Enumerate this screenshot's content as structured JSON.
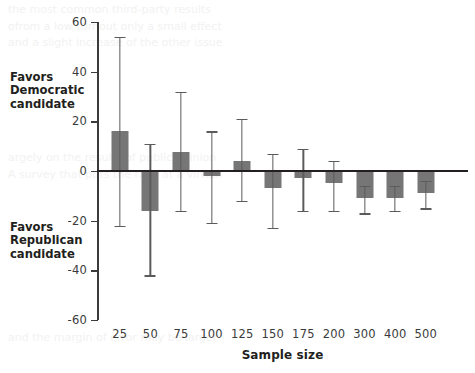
{
  "chart_data": {
    "type": "bar",
    "title": "",
    "subtitle": "",
    "xlabel": "Sample size",
    "ylabel": "",
    "categories": [
      "25",
      "50",
      "75",
      "100",
      "125",
      "150",
      "175",
      "200",
      "300",
      "400",
      "500"
    ],
    "values": [
      16,
      -16,
      7.5,
      -2,
      4,
      -7,
      -3,
      -5,
      -11,
      -11,
      -9
    ],
    "error_upper": [
      54,
      11,
      32,
      16,
      21,
      7,
      9,
      4,
      -6,
      -6,
      -4
    ],
    "error_lower": [
      -22,
      -42,
      -16,
      -21,
      -12,
      -23,
      -16,
      -16,
      -17,
      -16,
      -15
    ],
    "series": [
      {
        "name": "Margin",
        "values": [
          16,
          -16,
          7.5,
          -2,
          4,
          -7,
          -3,
          -5,
          -11,
          -11,
          -9
        ]
      }
    ],
    "ylim": [
      -60,
      60
    ],
    "yticks": [
      60,
      40,
      20,
      0,
      -20,
      -40,
      -60
    ],
    "ytick_labels": [
      "60",
      "40",
      "20",
      "0",
      "-20",
      "-40",
      "-60"
    ],
    "grid": false,
    "legend": false,
    "legend_position": "none",
    "bar_color": "#767676",
    "error_bar_color": "#5b5b5b",
    "axis_color": "#3b3b3b",
    "zero_line_color": "#231f20",
    "annotations": [
      {
        "id": "favors-democratic",
        "text": "Favors\nDemocratic\ncandidate",
        "position": "upper-left-outside"
      },
      {
        "id": "favors-republican",
        "text": "Favors\nRepublican\ncandidate",
        "position": "lower-left-outside"
      }
    ]
  },
  "labels": {
    "favors_democratic": "Favors\nDemocratic\ncandidate",
    "favors_republican": "Favors\nRepublican\ncandidate",
    "x_axis_title": "Sample size"
  },
  "background_bleed": {
    "top": "the most common third-party results\nofrom a low turnout only a small effect\nand a slight increase of the other issue",
    "middle": "argely on the results of public opinion\nA survey that puts the race at a virtual",
    "bottom": "and the margin of error may be larger"
  }
}
